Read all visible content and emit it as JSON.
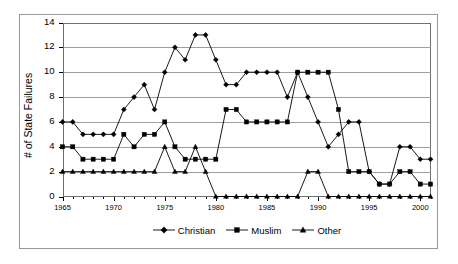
{
  "chart_data": {
    "type": "line",
    "title": "",
    "xlabel": "",
    "ylabel": "# of State Failures",
    "xlim": [
      1965,
      2001
    ],
    "ylim": [
      0,
      14
    ],
    "ytick_step": 2,
    "yticks": [
      0,
      2,
      4,
      6,
      8,
      10,
      12,
      14
    ],
    "xticks": [
      1965,
      1970,
      1975,
      1980,
      1985,
      1990,
      1995,
      2000
    ],
    "xtick_labels": [
      "1965",
      "1970",
      "1975",
      "1980",
      "1985",
      "1990",
      "1995",
      "2000"
    ],
    "ytick_labels": [
      "0",
      "2",
      "4",
      "6",
      "8",
      "10",
      "12",
      "14"
    ],
    "grid": "horizontal",
    "legend_position": "bottom",
    "x": [
      1965,
      1966,
      1967,
      1968,
      1969,
      1970,
      1971,
      1972,
      1973,
      1974,
      1975,
      1976,
      1977,
      1978,
      1979,
      1980,
      1981,
      1982,
      1983,
      1984,
      1985,
      1986,
      1987,
      1988,
      1989,
      1990,
      1991,
      1992,
      1993,
      1994,
      1995,
      1996,
      1997,
      1998,
      1999,
      2000,
      2001
    ],
    "series": [
      {
        "name": "Christian",
        "marker": "diamond",
        "color": "#000000",
        "values": [
          6,
          6,
          5,
          5,
          5,
          5,
          7,
          8,
          9,
          7,
          10,
          12,
          11,
          13,
          13,
          11,
          9,
          9,
          10,
          10,
          10,
          10,
          8,
          10,
          8,
          6,
          4,
          5,
          6,
          6,
          2,
          1,
          1,
          4,
          4,
          3,
          3
        ]
      },
      {
        "name": "Muslim",
        "marker": "square",
        "color": "#000000",
        "values": [
          4,
          4,
          3,
          3,
          3,
          3,
          5,
          4,
          5,
          5,
          6,
          4,
          3,
          3,
          3,
          3,
          7,
          7,
          6,
          6,
          6,
          6,
          6,
          10,
          10,
          10,
          10,
          7,
          2,
          2,
          2,
          1,
          1,
          2,
          2,
          1,
          1
        ]
      },
      {
        "name": "Other",
        "marker": "triangle",
        "color": "#000000",
        "values": [
          2,
          2,
          2,
          2,
          2,
          2,
          2,
          2,
          2,
          2,
          4,
          2,
          2,
          4,
          2,
          0,
          0,
          0,
          0,
          0,
          0,
          0,
          0,
          0,
          2,
          2,
          0,
          0,
          0,
          0,
          0,
          0,
          0,
          0,
          0,
          0,
          0
        ]
      }
    ],
    "legend": [
      {
        "label": "Christian",
        "marker": "diamond"
      },
      {
        "label": "Muslim",
        "marker": "square"
      },
      {
        "label": "Other",
        "marker": "triangle"
      }
    ]
  },
  "colors": {
    "series": "#000000",
    "grid": "#9e9e9e",
    "axis": "#6f6f6f",
    "outer_border": "#9a9a9a",
    "background": "#ffffff"
  }
}
